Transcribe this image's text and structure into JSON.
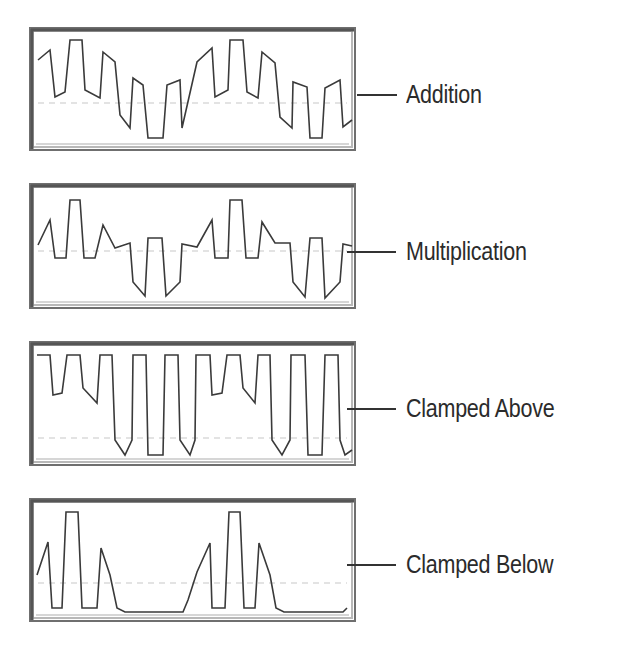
{
  "figure": {
    "panels": [
      {
        "label": "Addition"
      },
      {
        "label": "Multiplication"
      },
      {
        "label": "Clamped Above"
      },
      {
        "label": "Clamped Below"
      }
    ]
  },
  "colors": {
    "frame_dark": "#6f6f6f",
    "frame_light": "#b8b8b8",
    "wave": "#3a3a3a",
    "midline": "#c8c8c8",
    "text": "#2b2b2b"
  },
  "chart_data": [
    {
      "type": "line",
      "title": "Addition",
      "frame": {
        "x": 30,
        "y": 28,
        "w": 325,
        "h": 122
      },
      "midline_y": 103,
      "leader_y": 95,
      "points": [
        [
          38,
          60
        ],
        [
          50,
          50
        ],
        [
          55,
          97
        ],
        [
          65,
          92
        ],
        [
          70,
          40
        ],
        [
          82,
          40
        ],
        [
          85,
          90
        ],
        [
          100,
          98
        ],
        [
          103,
          52
        ],
        [
          115,
          62
        ],
        [
          120,
          115
        ],
        [
          130,
          128
        ],
        [
          133,
          78
        ],
        [
          143,
          85
        ],
        [
          148,
          138
        ],
        [
          163,
          138
        ],
        [
          167,
          85
        ],
        [
          180,
          80
        ],
        [
          182,
          128
        ],
        [
          197,
          62
        ],
        [
          212,
          48
        ],
        [
          215,
          97
        ],
        [
          228,
          90
        ],
        [
          230,
          40
        ],
        [
          243,
          40
        ],
        [
          247,
          92
        ],
        [
          258,
          98
        ],
        [
          262,
          52
        ],
        [
          275,
          63
        ],
        [
          280,
          117
        ],
        [
          292,
          128
        ],
        [
          293,
          82
        ],
        [
          307,
          87
        ],
        [
          310,
          138
        ],
        [
          322,
          138
        ],
        [
          325,
          88
        ],
        [
          340,
          80
        ],
        [
          343,
          127
        ],
        [
          352,
          120
        ]
      ],
      "grid": false
    },
    {
      "type": "line",
      "title": "Multiplication",
      "frame": {
        "x": 30,
        "y": 184,
        "w": 325,
        "h": 124
      },
      "midline_y": 251,
      "leader_y": 252,
      "points": [
        [
          38,
          245
        ],
        [
          50,
          220
        ],
        [
          55,
          258
        ],
        [
          66,
          258
        ],
        [
          70,
          200
        ],
        [
          80,
          200
        ],
        [
          84,
          258
        ],
        [
          95,
          258
        ],
        [
          103,
          225
        ],
        [
          115,
          248
        ],
        [
          130,
          243
        ],
        [
          133,
          282
        ],
        [
          145,
          296
        ],
        [
          148,
          238
        ],
        [
          162,
          238
        ],
        [
          166,
          296
        ],
        [
          180,
          282
        ],
        [
          182,
          244
        ],
        [
          197,
          247
        ],
        [
          212,
          220
        ],
        [
          215,
          258
        ],
        [
          228,
          258
        ],
        [
          230,
          200
        ],
        [
          242,
          200
        ],
        [
          246,
          258
        ],
        [
          258,
          258
        ],
        [
          262,
          222
        ],
        [
          275,
          243
        ],
        [
          290,
          243
        ],
        [
          293,
          282
        ],
        [
          305,
          297
        ],
        [
          310,
          238
        ],
        [
          322,
          238
        ],
        [
          325,
          298
        ],
        [
          340,
          282
        ],
        [
          343,
          244
        ],
        [
          352,
          246
        ]
      ],
      "grid": false
    },
    {
      "type": "line",
      "title": "Clamped Above",
      "frame": {
        "x": 30,
        "y": 342,
        "w": 325,
        "h": 123
      },
      "midline_y": 438,
      "leader_y": 409,
      "points": [
        [
          37,
          355
        ],
        [
          50,
          355
        ],
        [
          53,
          395
        ],
        [
          62,
          393
        ],
        [
          67,
          355
        ],
        [
          80,
          355
        ],
        [
          83,
          388
        ],
        [
          97,
          403
        ],
        [
          100,
          355
        ],
        [
          112,
          355
        ],
        [
          115,
          440
        ],
        [
          125,
          455
        ],
        [
          132,
          440
        ],
        [
          133,
          355
        ],
        [
          146,
          355
        ],
        [
          148,
          455
        ],
        [
          163,
          455
        ],
        [
          165,
          355
        ],
        [
          178,
          355
        ],
        [
          180,
          440
        ],
        [
          190,
          455
        ],
        [
          195,
          440
        ],
        [
          196,
          355
        ],
        [
          210,
          355
        ],
        [
          212,
          395
        ],
        [
          222,
          393
        ],
        [
          227,
          355
        ],
        [
          240,
          355
        ],
        [
          243,
          388
        ],
        [
          255,
          403
        ],
        [
          258,
          355
        ],
        [
          270,
          355
        ],
        [
          272,
          440
        ],
        [
          282,
          455
        ],
        [
          290,
          440
        ],
        [
          291,
          355
        ],
        [
          305,
          355
        ],
        [
          308,
          455
        ],
        [
          322,
          455
        ],
        [
          325,
          355
        ],
        [
          338,
          355
        ],
        [
          340,
          440
        ],
        [
          345,
          455
        ],
        [
          352,
          450
        ]
      ],
      "grid": false
    },
    {
      "type": "line",
      "title": "Clamped Below",
      "frame": {
        "x": 30,
        "y": 499,
        "w": 325,
        "h": 122
      },
      "midline_y": 583,
      "leader_y": 565,
      "points": [
        [
          37,
          575
        ],
        [
          48,
          542
        ],
        [
          52,
          608
        ],
        [
          62,
          608
        ],
        [
          66,
          512
        ],
        [
          78,
          512
        ],
        [
          82,
          608
        ],
        [
          97,
          608
        ],
        [
          101,
          548
        ],
        [
          110,
          575
        ],
        [
          117,
          608
        ],
        [
          125,
          612
        ],
        [
          183,
          612
        ],
        [
          188,
          600
        ],
        [
          197,
          572
        ],
        [
          210,
          543
        ],
        [
          212,
          608
        ],
        [
          225,
          608
        ],
        [
          229,
          512
        ],
        [
          240,
          512
        ],
        [
          244,
          608
        ],
        [
          255,
          608
        ],
        [
          259,
          543
        ],
        [
          270,
          575
        ],
        [
          276,
          608
        ],
        [
          284,
          612
        ],
        [
          343,
          612
        ],
        [
          347,
          608
        ]
      ],
      "grid": false
    }
  ]
}
